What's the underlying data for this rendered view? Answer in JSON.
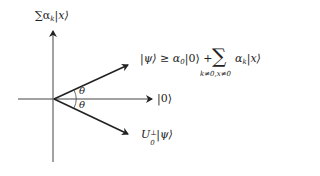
{
  "diagram": {
    "type": "vector-reflection",
    "axes": {
      "vertical_label": {
        "prefix": "∑α",
        "sub": "k",
        "suffix": "|x⟩"
      },
      "horizontal_label": "|0⟩"
    },
    "vectors": {
      "psi": {
        "lhs": "|ψ⟩ ≥ α",
        "sub": "0",
        "mid": "|0⟩ +",
        "sum_symbol": "∑",
        "sum_limits": "k≠0,x≠0",
        "term": "α",
        "term_sub": "k",
        "term_ket": "|x⟩"
      },
      "reflected": {
        "op": "U",
        "op_sub": "0",
        "op_sup": "⊥",
        "ket": "|ψ⟩"
      }
    },
    "angles": {
      "upper": "θ",
      "lower": "θ"
    },
    "colors": {
      "line": "#222222",
      "axis": "#444444"
    }
  }
}
